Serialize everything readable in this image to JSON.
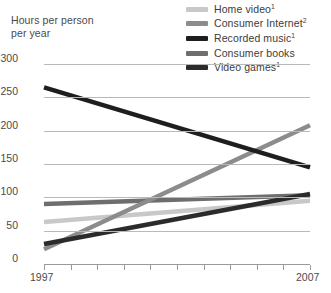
{
  "axis_title": "Hours per person\nper year",
  "legend": {
    "items": [
      {
        "label": "Home video",
        "sup": "1",
        "color": "#c8c8c8",
        "name": "home-video"
      },
      {
        "label": "Consumer Internet",
        "sup": "2",
        "color": "#8c8c8c",
        "name": "consumer-internet"
      },
      {
        "label": "Recorded music",
        "sup": "1",
        "color": "#1e1e1e",
        "name": "recorded-music"
      },
      {
        "label": "Consumer books",
        "sup": "",
        "color": "#6e6e6e",
        "name": "consumer-books"
      },
      {
        "label": "Video games",
        "sup": "1",
        "color": "#2b2b2b",
        "name": "video-games"
      }
    ]
  },
  "chart_data": {
    "type": "line",
    "title": "",
    "xlabel": "",
    "ylabel": "Hours per person per year",
    "xlim": [
      1997,
      2007
    ],
    "ylim": [
      0,
      300
    ],
    "yticks": [
      0,
      50,
      100,
      150,
      200,
      250,
      300
    ],
    "xticks": [
      1997,
      1998,
      1999,
      2000,
      2001,
      2002,
      2003,
      2004,
      2005,
      2006,
      2007
    ],
    "xtick_labels_shown": [
      "1997",
      "2007"
    ],
    "grid": true,
    "legend_position": "top-right",
    "x": [
      1997,
      2007
    ],
    "series": [
      {
        "name": "Home video",
        "values": [
          63,
          95
        ],
        "color": "#c8c8c8"
      },
      {
        "name": "Consumer Internet",
        "values": [
          22,
          208
        ],
        "color": "#8c8c8c"
      },
      {
        "name": "Recorded music",
        "values": [
          265,
          145
        ],
        "color": "#1e1e1e"
      },
      {
        "name": "Consumer books",
        "values": [
          90,
          103
        ],
        "color": "#6e6e6e"
      },
      {
        "name": "Video games",
        "values": [
          30,
          105
        ],
        "color": "#2b2b2b"
      }
    ],
    "annotations": [
      {
        "text": "Consumer Internet overtakes Recorded music near 2005 at about 175 hours"
      }
    ]
  }
}
